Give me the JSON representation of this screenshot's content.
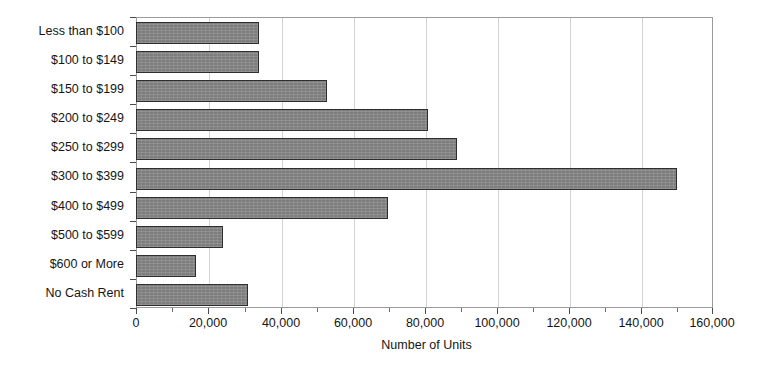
{
  "chart_data": {
    "type": "bar",
    "orientation": "horizontal",
    "title": "",
    "xlabel": "Number of Units",
    "ylabel": "",
    "categories": [
      "Less than $100",
      "$100 to $149",
      "$150 to $199",
      "$200 to $249",
      "$250 to $299",
      "$300 to $399",
      "$400 to $499",
      "$500 to $599",
      "$600 or More",
      "No Cash Rent"
    ],
    "values": [
      34000,
      34000,
      53000,
      81000,
      89000,
      150000,
      70000,
      24000,
      16500,
      31000
    ],
    "xlim": [
      0,
      160000
    ],
    "xticks": [
      0,
      20000,
      40000,
      60000,
      80000,
      100000,
      120000,
      140000,
      160000
    ],
    "xtick_labels": [
      "0",
      "20,000",
      "40,000",
      "60,000",
      "80,000",
      "100,000",
      "120,000",
      "140,000",
      "160,000"
    ],
    "minor_ticks": [
      10000,
      30000,
      50000,
      70000,
      90000,
      110000,
      130000,
      150000
    ],
    "gridlines": [
      20000,
      40000,
      60000,
      80000,
      100000,
      120000,
      140000
    ],
    "grid": true,
    "legend": null,
    "bar_fill_color": "#7d7d7d",
    "bar_edge_color": "#2e2e2e",
    "frame_color": "#9a9a9a",
    "gridline_color": "#d2d2d2"
  }
}
